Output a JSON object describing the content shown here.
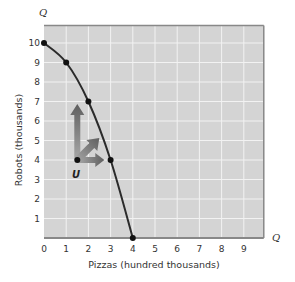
{
  "chart_data": {
    "type": "line",
    "title": "",
    "xlabel": "Pizzas (hundred thousands)",
    "ylabel": "Robots (thousands)",
    "x_axis_symbol": "Q",
    "y_axis_symbol": "Q",
    "xlim": [
      0,
      9.9
    ],
    "ylim": [
      0,
      10.9
    ],
    "x_ticks": [
      "0",
      "1",
      "2",
      "3",
      "4",
      "5",
      "6",
      "7",
      "8",
      "9"
    ],
    "y_ticks": [
      "1",
      "2",
      "3",
      "4",
      "5",
      "6",
      "7",
      "8",
      "9",
      "10"
    ],
    "grid": true,
    "series": [
      {
        "name": "Production possibilities frontier",
        "points": [
          {
            "x": 0,
            "y": 10
          },
          {
            "x": 1,
            "y": 9
          },
          {
            "x": 2,
            "y": 7
          },
          {
            "x": 3,
            "y": 4
          },
          {
            "x": 4,
            "y": 0
          }
        ]
      }
    ],
    "annotations": [
      {
        "label": "U",
        "x": 1.5,
        "y": 4,
        "note": "inefficient point inside frontier"
      },
      {
        "type": "arrow",
        "from": [
          1.5,
          4
        ],
        "to": [
          1.5,
          6.6
        ],
        "direction": "up"
      },
      {
        "type": "arrow",
        "from": [
          1.5,
          4
        ],
        "to": [
          2.5,
          4.9
        ],
        "direction": "diagonal"
      },
      {
        "type": "arrow",
        "from": [
          1.5,
          4
        ],
        "to": [
          2.7,
          4
        ],
        "direction": "right"
      }
    ]
  },
  "colors": {
    "plot_bg": "#d4d4d4",
    "grid": "#f2f2f2",
    "curve": "#2b2b2b",
    "arrow": "#6e6e6e"
  }
}
